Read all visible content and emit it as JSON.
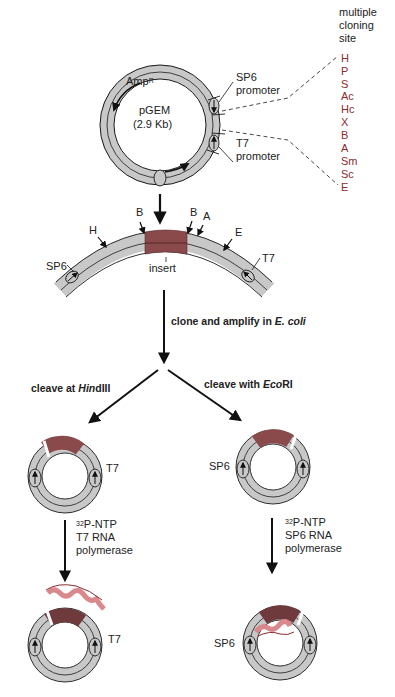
{
  "colors": {
    "ring_gray": "#c8c8c8",
    "ring_stroke": "#1a1a1a",
    "insert": "#8a4a4c",
    "site_text": "#8b2b2e",
    "rna": "#d9888c"
  },
  "plasmid": {
    "name": "pGEM",
    "size": "(2.9 Kb)",
    "resistance": "Amp",
    "resistance_sup": "R",
    "sp6_label": "SP6",
    "sp6_sub": "promoter",
    "t7_label": "T7",
    "t7_sub": "promoter"
  },
  "mcs": {
    "title_lines": [
      "multiple",
      "cloning",
      "site"
    ],
    "sites": [
      "H",
      "P",
      "S",
      "Ac",
      "Hc",
      "X",
      "B",
      "A",
      "Sm",
      "Sc",
      "E"
    ]
  },
  "linear_map": {
    "left": "SP6",
    "right": "T7",
    "insert_label": "insert",
    "sites": [
      "H",
      "B",
      "B",
      "A",
      "E"
    ]
  },
  "steps": {
    "clone_prefix": "clone and amplify in ",
    "clone_organism": "E. coli",
    "left_prefix": "cleave at ",
    "left_enzyme_italic": "Hin",
    "left_enzyme_rest": "dIII",
    "right_prefix": "cleave with ",
    "right_enzyme_italic": "Eco",
    "right_enzyme_rest": "RI"
  },
  "left_branch": {
    "promoter_label": "T7",
    "reagent_sup": "32",
    "reagent": "P-NTP",
    "polymerase_line1": "T7 RNA",
    "polymerase_line2": "polymerase",
    "final_label": "T7"
  },
  "right_branch": {
    "promoter_label": "SP6",
    "reagent_sup": "32",
    "reagent": "P-NTP",
    "polymerase_line1": "SP6 RNA",
    "polymerase_line2": "polymerase",
    "final_label": "SP6"
  }
}
